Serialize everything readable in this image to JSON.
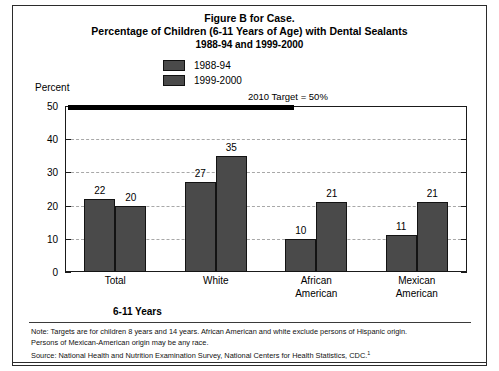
{
  "figure": {
    "title_line_1": "Figure B for Case.",
    "title_line_2": "Percentage of Children (6-11 Years of Age) with Dental Sealants",
    "title_line_3": "1988-94 and 1999-2000",
    "percent_label": "Percent",
    "axis_title": "6-11 Years",
    "target_annotation": "2010 Target = 50%",
    "footnotes": [
      "Note: Targets are for children 8 years and 14 years. African American and white exclude persons of Hispanic origin.",
      "Persons of Mexican-American origin may be any race.",
      "Source: National Health and Nutrition Examination Survey, National Centers for Health Statistics, CDC."
    ],
    "footnote_superscript": "1"
  },
  "colors": {
    "bar_fill": "#4a4a4a",
    "bar_border": "#131313",
    "axis": "#1a1a1a",
    "gridline": "#a8a8a8",
    "target_bar": "#000000",
    "frame": "#2b2b2b"
  },
  "chart_data": {
    "type": "bar",
    "xlabel": "6-11 Years",
    "ylabel": "Percent",
    "ylim": [
      0,
      50
    ],
    "yticks": [
      0,
      10,
      20,
      30,
      40,
      50
    ],
    "grid": true,
    "legend_position": "top-center",
    "categories": [
      "Total",
      "White",
      "African American",
      "Mexican American"
    ],
    "series": [
      {
        "name": "1988-94",
        "values": [
          22,
          27,
          10,
          11
        ],
        "color": "#4a4a4a"
      },
      {
        "name": "1999-2000",
        "values": [
          20,
          35,
          21,
          21
        ],
        "color": "#4a4a4a"
      }
    ],
    "annotations": [
      {
        "label": "2010 Target = 50%",
        "value": 50,
        "type": "target-line"
      }
    ]
  }
}
